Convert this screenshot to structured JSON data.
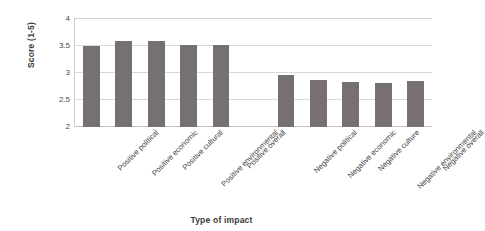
{
  "chart_data": {
    "type": "bar",
    "title": "",
    "xlabel": "Type of impact",
    "ylabel": "Score (1-5)",
    "ylim": [
      2,
      4
    ],
    "yticks": [
      "2",
      "2.5",
      "3",
      "3.5",
      "4"
    ],
    "grid": true,
    "legend": "none",
    "bar_color": "#767070",
    "categories": [
      "Positive political",
      "Positive economic",
      "Positive cultural",
      "Positive environmental",
      "Positive overall",
      "",
      "Negative political",
      "Negative economic",
      "Negative culture",
      "Negative environmental",
      "Negative overall"
    ],
    "values": [
      3.49,
      3.57,
      3.57,
      3.5,
      3.51,
      null,
      2.95,
      2.87,
      2.83,
      2.81,
      2.84
    ]
  }
}
